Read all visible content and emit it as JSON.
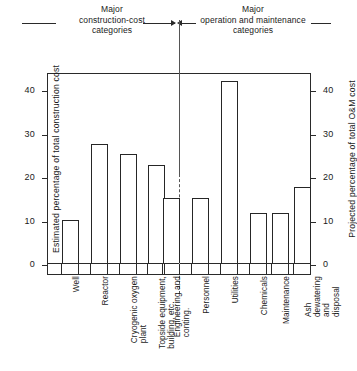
{
  "header": {
    "left_bracket": "Major\nconstruction-cost\ncategories",
    "right_bracket": "Major\noperation and maintenance\ncategories"
  },
  "axes": {
    "left_title": "Estimated percentage of total construction cost",
    "right_title": "Projected percentage of total O&M cost",
    "left_ticks": [
      "0",
      "10",
      "20",
      "30",
      "40"
    ],
    "right_ticks": [
      "0",
      "10",
      "20",
      "30",
      "40"
    ]
  },
  "chart_data": {
    "type": "bar",
    "title": "",
    "subtitle": "",
    "xlabel": "",
    "ylabel": "Estimated percentage of total construction cost",
    "ylabel_right": "Projected percentage of total O&M cost",
    "ylim": [
      0,
      44
    ],
    "yticks": [
      0,
      10,
      20,
      30,
      40
    ],
    "grid": false,
    "legend": "none",
    "groups": [
      {
        "name": "Major construction-cost categories",
        "categories": [
          "Well",
          "Reactor",
          "Cryogenic oxygen plant",
          "Topside equipment, building, etc.",
          "Engineering and conting."
        ],
        "values": [
          10,
          27.5,
          25,
          22.5,
          15
        ]
      },
      {
        "name": "Major operation and maintenance categories",
        "categories": [
          "Personnel",
          "Utilities",
          "Chemicals",
          "Maintenance",
          "Ash dewatering and disposal"
        ],
        "values": [
          15,
          42,
          11.5,
          11.5,
          17.5
        ]
      }
    ],
    "categories": [
      "Well",
      "Reactor",
      "Cryogenic oxygen plant",
      "Topside equipment, building, etc.",
      "Engineering and conting.",
      "Personnel",
      "Utilities",
      "Chemicals",
      "Maintenance",
      "Ash dewatering and disposal"
    ],
    "values": [
      10,
      27.5,
      25,
      22.5,
      15,
      15,
      42,
      11.5,
      11.5,
      17.5
    ]
  },
  "category_labels": [
    "Well",
    "Reactor",
    "Cryogenic oxygen\nplant",
    "Topside equipment,\nbuilding, etc.",
    "Engineering and\nconting.",
    "Personnel",
    "Utilities",
    "Chemicals",
    "Maintenance",
    "Ash dewatering\nand disposal"
  ],
  "colors": {
    "bar_stroke": "#262626",
    "bar_fill": "#ffffff",
    "axis": "#2a2a2a",
    "background": "#ffffff"
  }
}
